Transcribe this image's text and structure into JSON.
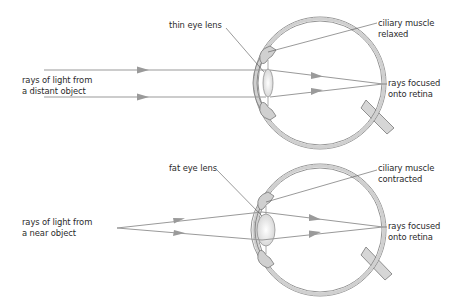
{
  "panels": [
    {
      "id": "distant",
      "lens_label": "thin eye lens",
      "muscle_label_line1": "ciliary muscle",
      "muscle_label_line2": "relaxed",
      "source_label_line1": "rays of light from",
      "source_label_line2": "a distant object",
      "focus_label_line1": "rays focused",
      "focus_label_line2": "onto retina"
    },
    {
      "id": "near",
      "lens_label": "fat eye lens",
      "muscle_label_line1": "ciliary muscle",
      "muscle_label_line2": "contracted",
      "source_label_line1": "rays of light from",
      "source_label_line2": "a near object",
      "focus_label_line1": "rays focused",
      "focus_label_line2": "onto retina"
    }
  ],
  "colors": {
    "ray": "#9a9a9a",
    "eye_wall": "#cfcfcf",
    "eye_outline": "#777777",
    "leader": "#555555",
    "text": "#2a2a2a"
  }
}
